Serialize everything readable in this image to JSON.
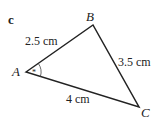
{
  "part_label": "c",
  "vertices": {
    "A": {
      "label": "A"
    },
    "B": {
      "label": "B"
    },
    "C": {
      "label": "C"
    }
  },
  "sides": {
    "AB": "2.5 cm",
    "BC": "3.5 cm",
    "AC": "4 cm"
  },
  "angle_marker": {
    "vertex": "A",
    "symbol": "*"
  }
}
